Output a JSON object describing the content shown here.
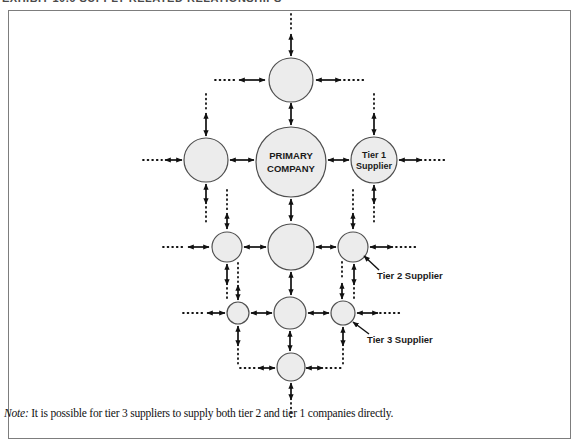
{
  "exhibit": {
    "title_clipped": "EXHIBIT 10.6  SUPPLY RELATED RELATIONSHIPS"
  },
  "diagram": {
    "primary_company": {
      "line1": "PRIMARY",
      "line2": "COMPANY"
    },
    "tier1_supplier": {
      "line1": "Tier 1",
      "line2": "Supplier"
    },
    "tier2_callout": "Tier 2 Supplier",
    "tier3_callout": "Tier 3 Supplier",
    "colors": {
      "node_fill": "#ececec",
      "node_stroke": "#4f4f4f",
      "arrow": "#111111",
      "frame": "#7d7d7d"
    }
  },
  "note": {
    "prefix": "Note:",
    "body": " It is possible for tier 3 suppliers to supply both tier 2 and tier 1 companies directly."
  }
}
